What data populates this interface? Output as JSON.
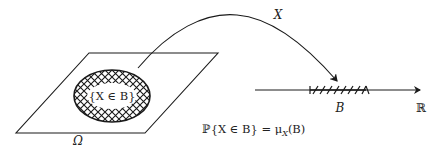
{
  "diagram": {
    "colors": {
      "stroke": "#1a1a1a",
      "background": "#ffffff"
    },
    "labels": {
      "sample_space": "Ω",
      "event": "{X ∈ B}",
      "mapping": "X",
      "borel_set": "B",
      "real_line": "ℝ",
      "formula": "ℙ{X ∈ B} = μ",
      "formula_sub": "X",
      "formula_tail": "(B)"
    }
  }
}
